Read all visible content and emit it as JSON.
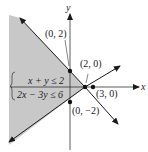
{
  "diagram": {
    "axes": {
      "x_label": "x",
      "y_label": "y"
    },
    "points": [
      {
        "label": "(0, 2)",
        "x": 0,
        "y": 2
      },
      {
        "label": "(2, 0)",
        "x": 2,
        "y": 0
      },
      {
        "label": "(3, 0)",
        "x": 3,
        "y": 0
      },
      {
        "label": "(0, −2)",
        "x": 0,
        "y": -2
      }
    ],
    "system": {
      "inequality_1": "x + y ≤ 2",
      "inequality_2": "2x − 3y ≤ 6"
    },
    "lines": [
      {
        "equation": "x + y = 2"
      },
      {
        "equation": "2x − 3y = 6"
      }
    ],
    "colors": {
      "shade": "#c8c8c8",
      "line": "#1a1a1a"
    }
  }
}
